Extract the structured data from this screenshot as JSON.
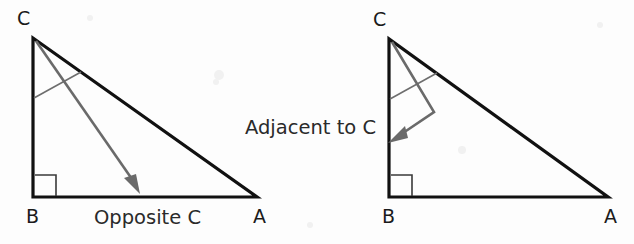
{
  "figure": {
    "title_text": "",
    "background_color": "#fdfdfd",
    "stroke_color": "#111111",
    "pointer_color": "#6a6a6a",
    "arc_color": "#6e6e6e",
    "right_angle_color": "#3a3a3a"
  },
  "diagrams": [
    {
      "id": "opposite-diagram",
      "vertices": {
        "C": "C",
        "B": "B",
        "A": "A"
      },
      "annotation": "Opposite C",
      "pointer_target": "side BA (the side opposite angle C)",
      "right_angle_at": "B"
    },
    {
      "id": "adjacent-diagram",
      "vertices": {
        "C": "C",
        "B": "B",
        "A": "A"
      },
      "annotation": "Adjacent to C",
      "pointer_target": "side CB (the side adjacent to angle C)",
      "right_angle_at": "B"
    }
  ],
  "labels": {
    "left_vertex_c": "C",
    "left_vertex_b": "B",
    "left_vertex_a": "A",
    "left_side_label": "Opposite C",
    "right_vertex_c": "C",
    "right_vertex_b": "B",
    "right_vertex_a": "A",
    "center_label": "Adjacent to C"
  }
}
